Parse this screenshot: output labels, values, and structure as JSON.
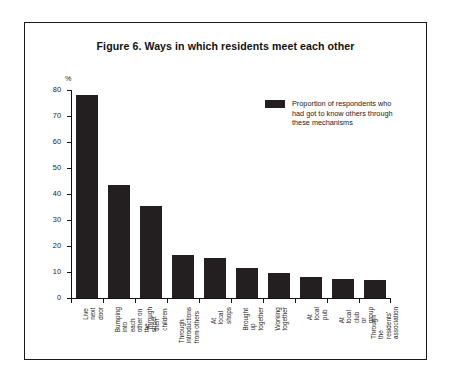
{
  "figure": {
    "title": "Figure 6. Ways in which residents meet each other",
    "y_unit": "%"
  },
  "legend": {
    "label": "Proportion of respondents who\nhad got to know others through\nthese mechanisms",
    "swatch_color": "#231f20"
  },
  "chart_data": {
    "type": "bar",
    "title": "Figure 6. Ways in which residents meet each other",
    "xlabel": "",
    "ylabel": "%",
    "ylim": [
      0,
      80
    ],
    "yticks": [
      0,
      10,
      20,
      30,
      40,
      50,
      60,
      70,
      80
    ],
    "ytick_labels": [
      "0",
      "10",
      "20",
      "30",
      "40",
      "50",
      "60",
      "70",
      "80"
    ],
    "grid": false,
    "legend_position": "top-right",
    "bar_color": "#231f20",
    "categories": [
      "Live next door",
      "Bumping into\neach other on\nthe street",
      "Through their\nchildren",
      "Through\nintroductions\nfrom others",
      "At local shops",
      "Brought up\ntogether",
      "Working\ntogether",
      "At local pub",
      "At local club\nor group",
      "Through the\nresidents'\nassociation"
    ],
    "series": [
      {
        "name": "Proportion of respondents who had got to know others through these mechanisms",
        "values": [
          78,
          43.5,
          35.5,
          16.5,
          15.5,
          11.5,
          9.5,
          8,
          7.5,
          7
        ]
      }
    ]
  }
}
